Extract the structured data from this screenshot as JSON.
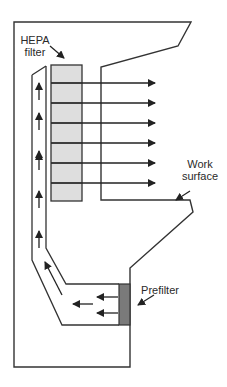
{
  "diagram": {
    "labels": {
      "hepa_line1": "HEPA",
      "hepa_line2": "filter",
      "work_line1": "Work",
      "work_line2": "surface",
      "prefilter": "Prefilter"
    },
    "colors": {
      "line": "#333333",
      "hepa_fill": "#dedede",
      "prefilter_fill": "#7a7a7a",
      "background": "#ffffff"
    },
    "components": [
      {
        "name": "HEPA filter",
        "x": 51,
        "y": 65,
        "width": 31,
        "height": 136,
        "sections": 7
      },
      {
        "name": "Prefilter",
        "x": 119,
        "y": 284,
        "width": 11,
        "height": 41
      },
      {
        "name": "Work surface",
        "y": 200
      }
    ],
    "airflow": {
      "horizontal_out_arrows_y": [
        83,
        103,
        123,
        143,
        163,
        183
      ],
      "duct_up_arrows_count": 6,
      "prefilter_in_arrows_count": 3,
      "diagonal_arrows_count": 1
    }
  }
}
